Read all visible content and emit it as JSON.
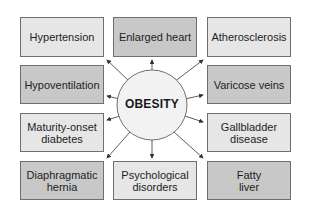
{
  "diagram": {
    "center": {
      "label": "OBESITY"
    },
    "conditions": [
      {
        "id": "hypertension",
        "label": "Hypertension",
        "shade": "light"
      },
      {
        "id": "enlarged-heart",
        "label": "Enlarged heart",
        "shade": "dark"
      },
      {
        "id": "atherosclerosis",
        "label": "Atherosclerosis",
        "shade": "light"
      },
      {
        "id": "hypoventilation",
        "label": "Hypoventilation",
        "shade": "dark"
      },
      {
        "id": "varicose-veins",
        "label": "Varicose veins",
        "shade": "dark"
      },
      {
        "id": "maturity-onset-diabetes",
        "label": "Maturity-onset diabetes",
        "shade": "light"
      },
      {
        "id": "gallbladder-disease",
        "label": "Gallbladder disease",
        "shade": "light"
      },
      {
        "id": "diaphragmatic-hernia",
        "label": "Diaphragmatic hernia",
        "shade": "dark"
      },
      {
        "id": "psychological-disorders",
        "label": "Psychological disorders",
        "shade": "light"
      },
      {
        "id": "fatty-liver",
        "label": "Fatty liver",
        "shade": "dark"
      }
    ],
    "colors": {
      "light_box": "#e6e6e6",
      "dark_box": "#c8c8c8",
      "border": "#6f6f6f",
      "arrow": "#333333",
      "circle_fill": "#f2f2f2"
    }
  }
}
